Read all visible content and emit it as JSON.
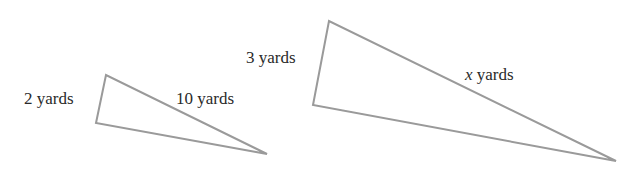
{
  "diagram": {
    "stroke_color": "#9a9a9a",
    "text_color": "#2a2a2a",
    "small_triangle": {
      "side_label": "2 yards",
      "hyp_label": "10 yards",
      "points": "106,75 96,123 267,154"
    },
    "large_triangle": {
      "side_label": "3 yards",
      "hyp_var": "x",
      "hyp_unit": " yards",
      "points": "329,21 313,105 616,161"
    }
  }
}
